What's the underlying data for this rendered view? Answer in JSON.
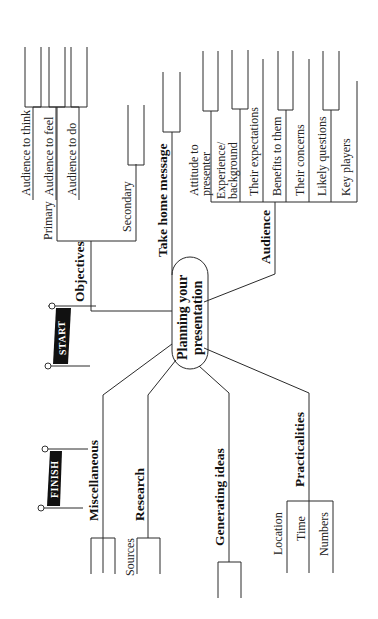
{
  "center": {
    "line1": "Planning your",
    "line2": "presentation"
  },
  "flags": {
    "start": "START",
    "finish": "FINISH"
  },
  "branches": {
    "objectives": {
      "label": "Objectives",
      "primary": "Primary",
      "secondary": "Secondary",
      "items": [
        "Audience to think",
        "Audience to feel",
        "Audience to do"
      ]
    },
    "take_home": {
      "label": "Take home message"
    },
    "audience": {
      "label": "Audience",
      "items": [
        {
          "l1": "Attitude to",
          "l2": "presenter"
        },
        {
          "l1": "Experience/",
          "l2": "background"
        },
        {
          "l1": "Their expectations"
        },
        {
          "l1": "Benefits to them"
        },
        {
          "l1": "Their concerns"
        },
        {
          "l1": "Likely questions"
        },
        {
          "l1": "Key players"
        }
      ]
    },
    "miscellaneous": {
      "label": "Miscellaneous"
    },
    "research": {
      "label": "Research",
      "items": [
        "Sources"
      ]
    },
    "generating_ideas": {
      "label": "Generating ideas"
    },
    "practicalities": {
      "label": "Practicalities",
      "items": [
        "Location",
        "Time",
        "Numbers"
      ]
    }
  }
}
